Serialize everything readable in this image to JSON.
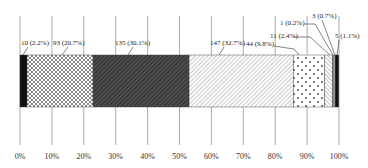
{
  "chart_data": {
    "type": "bar",
    "orientation": "horizontal-stacked-100",
    "title": "",
    "xlabel": "",
    "ylabel": "",
    "xlim": [
      0,
      100
    ],
    "grid": true,
    "legend": null,
    "x_ticks": [
      "0%",
      "10%",
      "20%",
      "30%",
      "40%",
      "50%",
      "60%",
      "70%",
      "80%",
      "90%",
      "100%"
    ],
    "series": [
      {
        "count": 10,
        "percent": 2.2,
        "label": "10 (2.2%)",
        "pattern": "solid-black"
      },
      {
        "count": 93,
        "percent": 20.7,
        "label": "93 (20.7%)",
        "pattern": "crosshatch"
      },
      {
        "count": 135,
        "percent": 30.1,
        "label": "135 (30.1%)",
        "pattern": "dark-diagonal"
      },
      {
        "count": 147,
        "percent": 32.7,
        "label": "147 (32.7%)",
        "pattern": "light-diagonal"
      },
      {
        "count": 44,
        "percent": 9.8,
        "label": "44 (9.8%)",
        "pattern": "dots"
      },
      {
        "count": 11,
        "percent": 2.4,
        "label": "11 (2.4%)",
        "pattern": "diagonal"
      },
      {
        "count": 1,
        "percent": 0.2,
        "label": "1 (0.2%)",
        "pattern": "white"
      },
      {
        "count": 3,
        "percent": 0.7,
        "label": "3 (0.7%)",
        "pattern": "gray"
      },
      {
        "count": 5,
        "percent": 1.1,
        "label": "5 (1.1%)",
        "pattern": "solid-black"
      }
    ]
  }
}
